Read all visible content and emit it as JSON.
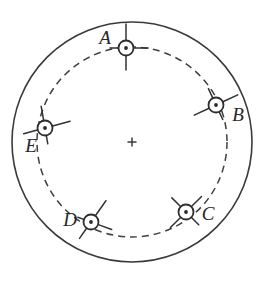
{
  "figure": {
    "background_color": "#ffffff",
    "line_color": "#3a3a3a",
    "width": 268,
    "height": 283
  },
  "geometry": {
    "center": {
      "x": 132,
      "y": 142
    },
    "outer_circle": {
      "cx": 132,
      "cy": 142,
      "r": 120,
      "style": "solid"
    },
    "dashed_circle": {
      "cx": 132,
      "cy": 142,
      "r": 95,
      "style": "dashed"
    },
    "center_marker": {
      "type": "plus-icon",
      "x": 132,
      "y": 142,
      "size": 9
    }
  },
  "stations": [
    {
      "id": "A",
      "label": "A",
      "marker_icon": "circle-dot-cross-icon",
      "cx": 126,
      "cy": 48,
      "r": 7.5,
      "label_x": 105,
      "label_y": 40,
      "ticks": [
        {
          "angle": 90,
          "inner": 7,
          "outer": 24
        },
        {
          "angle": 270,
          "inner": 7,
          "outer": 22
        },
        {
          "angle": 0,
          "inner": 7,
          "outer": 22
        },
        {
          "angle": 180,
          "inner": 7,
          "outer": 16
        }
      ]
    },
    {
      "id": "B",
      "label": "B",
      "marker_icon": "circle-dot-cross-icon",
      "cx": 216,
      "cy": 105,
      "r": 7.5,
      "label_x": 238,
      "label_y": 117,
      "ticks": [
        {
          "angle": 25,
          "inner": 7,
          "outer": 24
        },
        {
          "angle": 205,
          "inner": 7,
          "outer": 24
        },
        {
          "angle": 115,
          "inner": 7,
          "outer": 18
        },
        {
          "angle": 295,
          "inner": 7,
          "outer": 16
        }
      ]
    },
    {
      "id": "C",
      "label": "C",
      "marker_icon": "circle-dot-cross-icon",
      "cx": 186,
      "cy": 212,
      "r": 7.5,
      "label_x": 208,
      "label_y": 216,
      "ticks": [
        {
          "angle": 45,
          "inner": 7,
          "outer": 22
        },
        {
          "angle": 225,
          "inner": 7,
          "outer": 22
        },
        {
          "angle": 135,
          "inner": 7,
          "outer": 20
        },
        {
          "angle": 315,
          "inner": 7,
          "outer": 18
        }
      ]
    },
    {
      "id": "D",
      "label": "D",
      "marker_icon": "circle-dot-cross-icon",
      "cx": 91,
      "cy": 222,
      "r": 7.5,
      "label_x": 70,
      "label_y": 222,
      "ticks": [
        {
          "angle": 55,
          "inner": 7,
          "outer": 26
        },
        {
          "angle": 235,
          "inner": 7,
          "outer": 20
        },
        {
          "angle": 340,
          "inner": 7,
          "outer": 22
        },
        {
          "angle": 160,
          "inner": 7,
          "outer": 14
        }
      ]
    },
    {
      "id": "E",
      "label": "E",
      "marker_icon": "circle-dot-cross-icon",
      "cx": 45,
      "cy": 128,
      "r": 7.5,
      "label_x": 31,
      "label_y": 148,
      "ticks": [
        {
          "angle": 15,
          "inner": 7,
          "outer": 26
        },
        {
          "angle": 195,
          "inner": 7,
          "outer": 22
        },
        {
          "angle": 100,
          "inner": 7,
          "outer": 22
        },
        {
          "angle": 280,
          "inner": 7,
          "outer": 16
        }
      ]
    }
  ]
}
